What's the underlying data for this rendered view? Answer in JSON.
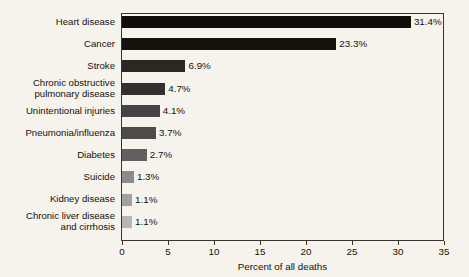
{
  "chart_data": {
    "type": "bar",
    "orientation": "horizontal",
    "title": "",
    "xlabel": "Percent of all deaths",
    "ylabel": "",
    "xlim": [
      0,
      35
    ],
    "xticks": [
      0,
      5,
      10,
      15,
      20,
      25,
      30,
      35
    ],
    "grid": false,
    "legend": false,
    "categories": [
      "Heart disease",
      "Cancer",
      "Stroke",
      "Chronic obstructive\npulmonary disease",
      "Unintentional injuries",
      "Pneumonia/influenza",
      "Diabetes",
      "Suicide",
      "Kidney disease",
      "Chronic liver disease\nand cirrhosis"
    ],
    "values": [
      31.4,
      23.3,
      6.9,
      4.7,
      4.1,
      3.7,
      2.7,
      1.3,
      1.1,
      1.1
    ],
    "value_labels": [
      "31.4%",
      "23.3%",
      "6.9%",
      "4.7%",
      "4.1%",
      "3.7%",
      "2.7%",
      "1.3%",
      "1.1%",
      "1.1%"
    ],
    "bar_colors": [
      "#100d0a",
      "#15110d",
      "#2b2723",
      "#333030",
      "#464343",
      "#4e4b4a",
      "#626060",
      "#8e8c8b",
      "#a3a1a0",
      "#b8b6b4"
    ]
  },
  "axis": {
    "tick_labels": [
      "0",
      "5",
      "10",
      "15",
      "20",
      "25",
      "30",
      "35"
    ],
    "title": "Percent of all deaths"
  },
  "colors": {
    "background": "#f6f3ec",
    "axis_line": "#3a342c",
    "text": "#15110d"
  }
}
